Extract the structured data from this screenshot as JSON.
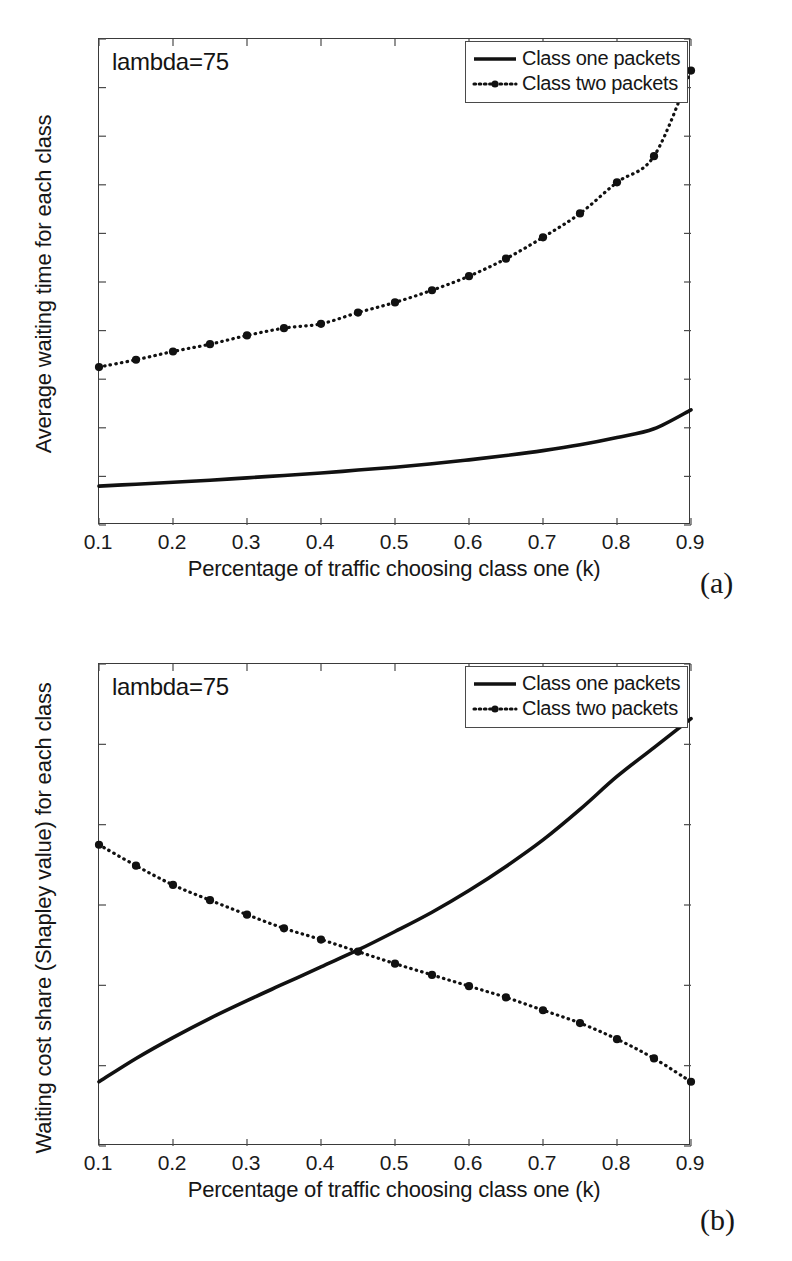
{
  "figure": {
    "panels": [
      {
        "id": "panel-a",
        "caption": "(a)",
        "annotation": "lambda=75",
        "legend": [
          {
            "label": "Class one packets",
            "style": "solid"
          },
          {
            "label": "Class two packets",
            "style": "dotted-marker"
          }
        ]
      },
      {
        "id": "panel-b",
        "caption": "(b)",
        "annotation": "lambda=75",
        "legend": [
          {
            "label": "Class one packets",
            "style": "solid"
          },
          {
            "label": "Class two packets",
            "style": "dotted-marker"
          }
        ]
      }
    ]
  },
  "chart_data": [
    {
      "type": "line",
      "id": "chart-a",
      "title": "",
      "annotation": "lambda=75",
      "xlabel": "Percentage of traffic choosing class one (k)",
      "ylabel": "Average waiting time for each class",
      "xlim": [
        0.1,
        0.9
      ],
      "ylim": [
        0,
        0.1
      ],
      "xticks": [
        0.1,
        0.2,
        0.3,
        0.4,
        0.5,
        0.6,
        0.7,
        0.8,
        0.9
      ],
      "xticklabels": [
        "0.1",
        "0.2",
        "0.3",
        "0.4",
        "0.5",
        "0.6",
        "0.7",
        "0.8",
        "0.9"
      ],
      "yticks": [
        0,
        0.01,
        0.02,
        0.03,
        0.04,
        0.05,
        0.06,
        0.07,
        0.08,
        0.09,
        0.1
      ],
      "yticklabels": [
        "0",
        "0.01",
        "0.02",
        "0.03",
        "0.04",
        "0.05",
        "0.06",
        "0.07",
        "0.08",
        "0.09",
        "0.1"
      ],
      "grid": false,
      "legend_position": "top-right",
      "x": [
        0.1,
        0.15,
        0.2,
        0.25,
        0.3,
        0.35,
        0.4,
        0.45,
        0.5,
        0.55,
        0.6,
        0.65,
        0.7,
        0.75,
        0.8,
        0.85,
        0.9
      ],
      "series": [
        {
          "name": "Class one packets",
          "style": "solid",
          "markers": false,
          "values": [
            0.008,
            0.0084,
            0.0088,
            0.0092,
            0.0097,
            0.0102,
            0.0107,
            0.0113,
            0.0119,
            0.0126,
            0.0134,
            0.0143,
            0.0153,
            0.0165,
            0.018,
            0.0198,
            0.0237
          ]
        },
        {
          "name": "Class two packets",
          "style": "dotted",
          "markers": true,
          "values": [
            0.0325,
            0.034,
            0.0357,
            0.0372,
            0.039,
            0.0405,
            0.0414,
            0.0437,
            0.0458,
            0.0483,
            0.0512,
            0.0548,
            0.0592,
            0.0641,
            0.0705,
            0.0759,
            0.0837
          ]
        }
      ],
      "endpoint_extra": {
        "series": "Class two packets",
        "x": 0.9,
        "y": 0.0935
      }
    },
    {
      "type": "line",
      "id": "chart-b",
      "title": "",
      "annotation": "lambda=75",
      "xlabel": "Percentage of traffic choosing class one (k)",
      "ylabel": "Waiting cost share (Shapley value) for each class",
      "xlim": [
        0.1,
        0.9
      ],
      "ylim": [
        0,
        3
      ],
      "xticks": [
        0.1,
        0.2,
        0.3,
        0.4,
        0.5,
        0.6,
        0.7,
        0.8,
        0.9
      ],
      "xticklabels": [
        "0.1",
        "0.2",
        "0.3",
        "0.4",
        "0.5",
        "0.6",
        "0.7",
        "0.8",
        "0.9"
      ],
      "yticks": [
        0,
        0.5,
        1,
        1.5,
        2,
        2.5,
        3
      ],
      "yticklabels": [
        "0",
        "0.5",
        "1",
        "1.5",
        "2",
        "2.5",
        "3"
      ],
      "grid": false,
      "legend_position": "top-right",
      "x": [
        0.1,
        0.15,
        0.2,
        0.25,
        0.3,
        0.35,
        0.4,
        0.45,
        0.5,
        0.55,
        0.6,
        0.65,
        0.7,
        0.75,
        0.8,
        0.85,
        0.9
      ],
      "series": [
        {
          "name": "Class one packets",
          "style": "solid",
          "markers": false,
          "values": [
            0.4,
            0.545,
            0.675,
            0.795,
            0.905,
            1.01,
            1.115,
            1.22,
            1.335,
            1.455,
            1.59,
            1.74,
            1.905,
            2.095,
            2.3,
            2.48,
            2.66
          ]
        },
        {
          "name": "Class two packets",
          "style": "dotted",
          "markers": true,
          "values": [
            1.875,
            1.745,
            1.625,
            1.53,
            1.44,
            1.355,
            1.285,
            1.21,
            1.135,
            1.065,
            0.995,
            0.925,
            0.845,
            0.765,
            0.665,
            0.545,
            0.4
          ]
        }
      ]
    }
  ]
}
